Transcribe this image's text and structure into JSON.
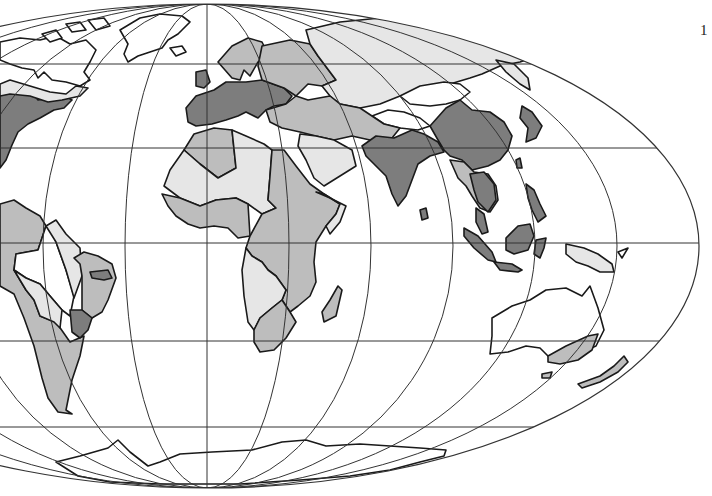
{
  "page": {
    "number": "1"
  },
  "map": {
    "projection": "Mollweide (world, cropped at left)",
    "style": "grayscale choropleth",
    "shades": {
      "dark": "#7d7d7d",
      "medium": "#bdbdbd",
      "light": "#e6e6e6",
      "none": "#ffffff",
      "outline": "#1a1a1a",
      "grid": "#333333"
    },
    "regions": [
      {
        "name": "North America (east coast)",
        "shade": "dark"
      },
      {
        "name": "Canada / Arctic",
        "shade": "none"
      },
      {
        "name": "Greenland",
        "shade": "none"
      },
      {
        "name": "Western & Central Europe",
        "shade": "dark"
      },
      {
        "name": "Scandinavia",
        "shade": "medium"
      },
      {
        "name": "Eastern Europe",
        "shade": "medium"
      },
      {
        "name": "Russia / Siberia",
        "shade": "light"
      },
      {
        "name": "Central Asia / Middle East",
        "shade": "medium"
      },
      {
        "name": "Arabian Peninsula",
        "shade": "light"
      },
      {
        "name": "South Asia (India)",
        "shade": "dark"
      },
      {
        "name": "China / Korea / Japan",
        "shade": "dark"
      },
      {
        "name": "Mongolia / Tibet",
        "shade": "none"
      },
      {
        "name": "Southeast Asia",
        "shade": "medium"
      },
      {
        "name": "Indonesia / Philippines",
        "shade": "dark"
      },
      {
        "name": "New Guinea",
        "shade": "light"
      },
      {
        "name": "North Africa (Algeria)",
        "shade": "medium"
      },
      {
        "name": "Sahara",
        "shade": "light"
      },
      {
        "name": "West Africa",
        "shade": "medium"
      },
      {
        "name": "East & Central Africa",
        "shade": "medium"
      },
      {
        "name": "Southern Africa (interior)",
        "shade": "light"
      },
      {
        "name": "Madagascar",
        "shade": "medium"
      },
      {
        "name": "Australia (interior)",
        "shade": "none"
      },
      {
        "name": "Southeast Australia",
        "shade": "medium"
      },
      {
        "name": "New Zealand",
        "shade": "medium"
      },
      {
        "name": "South America (Andes / Southern Cone)",
        "shade": "medium"
      },
      {
        "name": "Amazon Basin",
        "shade": "none"
      },
      {
        "name": "Brazil (east)",
        "shade": "medium"
      },
      {
        "name": "Brazil (southeast)",
        "shade": "dark"
      },
      {
        "name": "Antarctica",
        "shade": "none"
      }
    ],
    "graticule": {
      "center_x": 207,
      "center_y": 246,
      "rx": 492,
      "ry": 242,
      "parallels_y": [
        64,
        148,
        243,
        341,
        427
      ],
      "meridian_spacing_px_at_equator": 82
    }
  }
}
